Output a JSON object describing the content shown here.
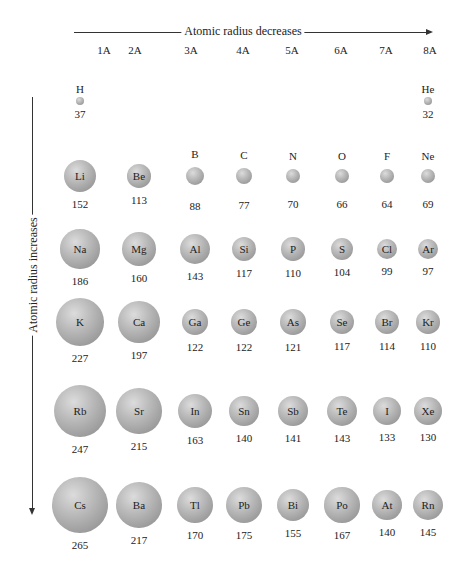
{
  "chart_data": {
    "type": "table",
    "horizontal_trend_label": "Atomic radius decreases",
    "vertical_trend_label": "Atomic radius increases",
    "groups": [
      "1A",
      "2A",
      "3A",
      "4A",
      "5A",
      "6A",
      "7A",
      "8A"
    ],
    "rows": [
      {
        "period": 1,
        "elements": [
          {
            "symbol": "H",
            "radius": 37,
            "group": "1A"
          },
          {
            "symbol": "He",
            "radius": 32,
            "group": "8A"
          }
        ]
      },
      {
        "period": 2,
        "elements": [
          {
            "symbol": "Li",
            "radius": 152
          },
          {
            "symbol": "Be",
            "radius": 113
          },
          {
            "symbol": "B",
            "radius": 88
          },
          {
            "symbol": "C",
            "radius": 77
          },
          {
            "symbol": "N",
            "radius": 70
          },
          {
            "symbol": "O",
            "radius": 66
          },
          {
            "symbol": "F",
            "radius": 64
          },
          {
            "symbol": "Ne",
            "radius": 69
          }
        ]
      },
      {
        "period": 3,
        "elements": [
          {
            "symbol": "Na",
            "radius": 186
          },
          {
            "symbol": "Mg",
            "radius": 160
          },
          {
            "symbol": "Al",
            "radius": 143
          },
          {
            "symbol": "Si",
            "radius": 117
          },
          {
            "symbol": "P",
            "radius": 110
          },
          {
            "symbol": "S",
            "radius": 104
          },
          {
            "symbol": "Cl",
            "radius": 99
          },
          {
            "symbol": "Ar",
            "radius": 97
          }
        ]
      },
      {
        "period": 4,
        "elements": [
          {
            "symbol": "K",
            "radius": 227
          },
          {
            "symbol": "Ca",
            "radius": 197
          },
          {
            "symbol": "Ga",
            "radius": 122
          },
          {
            "symbol": "Ge",
            "radius": 122
          },
          {
            "symbol": "As",
            "radius": 121
          },
          {
            "symbol": "Se",
            "radius": 117
          },
          {
            "symbol": "Br",
            "radius": 114
          },
          {
            "symbol": "Kr",
            "radius": 110
          }
        ]
      },
      {
        "period": 5,
        "elements": [
          {
            "symbol": "Rb",
            "radius": 247
          },
          {
            "symbol": "Sr",
            "radius": 215
          },
          {
            "symbol": "In",
            "radius": 163
          },
          {
            "symbol": "Sn",
            "radius": 140
          },
          {
            "symbol": "Sb",
            "radius": 141
          },
          {
            "symbol": "Te",
            "radius": 143
          },
          {
            "symbol": "I",
            "radius": 133
          },
          {
            "symbol": "Xe",
            "radius": 130
          }
        ]
      },
      {
        "period": 6,
        "elements": [
          {
            "symbol": "Cs",
            "radius": 265
          },
          {
            "symbol": "Ba",
            "radius": 217
          },
          {
            "symbol": "Tl",
            "radius": 170
          },
          {
            "symbol": "Pb",
            "radius": 175
          },
          {
            "symbol": "Bi",
            "radius": 155
          },
          {
            "symbol": "Po",
            "radius": 167
          },
          {
            "symbol": "At",
            "radius": 140
          },
          {
            "symbol": "Rn",
            "radius": 145
          }
        ]
      }
    ]
  },
  "labels": {
    "top_trend": "Atomic radius decreases",
    "side_trend": "Atomic radius increases",
    "groups": [
      "1A",
      "2A",
      "3A",
      "4A",
      "5A",
      "6A",
      "7A",
      "8A"
    ]
  },
  "colors": {
    "sphere_light": "#dcdcdc",
    "sphere_dark": "#888888",
    "line": "#333333"
  }
}
